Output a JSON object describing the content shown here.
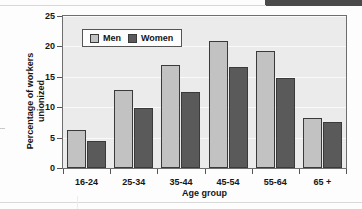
{
  "chart_data": {
    "type": "bar",
    "title": "",
    "categories": [
      "16-24",
      "25-34",
      "35-44",
      "45-54",
      "55-64",
      "65 +"
    ],
    "series": [
      {
        "name": "Men",
        "color": "#c2c2c2",
        "values": [
          6.2,
          12.8,
          16.9,
          20.9,
          19.2,
          8.3
        ]
      },
      {
        "name": "Women",
        "color": "#5a5a5a",
        "values": [
          4.4,
          9.9,
          12.5,
          16.6,
          14.8,
          7.5
        ]
      }
    ],
    "xlabel": "Age group",
    "ylabel": "Percentage of workers unionized",
    "ylabel_lines": [
      "Percentage of workers",
      "unionized"
    ],
    "ylim": [
      0,
      25
    ],
    "yticks": [
      0,
      5,
      10,
      15,
      20,
      25
    ],
    "ytick_labels": [
      "0",
      "5",
      "10",
      "15",
      "20",
      "25"
    ],
    "grid": true,
    "legend_position": "top-left-inside",
    "plot_background": "#ebebeb",
    "gridline_color": "#fafafa",
    "axis_color": "#6e6e6e"
  },
  "legend": {
    "entries": [
      {
        "label": "Men"
      },
      {
        "label": "Women"
      }
    ]
  }
}
